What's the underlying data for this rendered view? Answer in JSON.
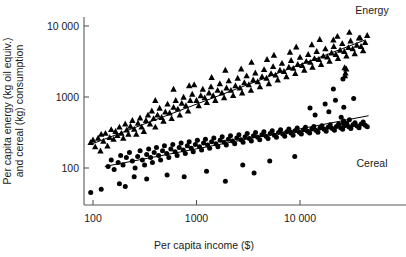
{
  "chart_data": {
    "type": "scatter",
    "title": "",
    "xlabel": "Per capita income ($)",
    "ylabel": "Per capita energy (kg oil equiv.) and cereal (kg) consumption",
    "xscale": "log",
    "yscale": "log",
    "xlim": [
      80,
      50000
    ],
    "ylim": [
      35,
      20000
    ],
    "grid": false,
    "legend_position": "inline-right",
    "xticks": [
      100,
      1000,
      10000
    ],
    "xticklabels": [
      "100",
      "1000",
      "10 000"
    ],
    "yticks": [
      100,
      1000,
      10000
    ],
    "yticklabels": [
      "100",
      "1000",
      "10 000"
    ],
    "series": [
      {
        "name": "Energy",
        "marker": "triangle",
        "color": "#000000",
        "label": "Energy",
        "trendline": {
          "x": [
            95,
            42000
          ],
          "y": [
            215,
            6300
          ]
        },
        "points": [
          [
            95,
            230
          ],
          [
            100,
            250
          ],
          [
            105,
            200
          ],
          [
            112,
            265
          ],
          [
            118,
            175
          ],
          [
            120,
            300
          ],
          [
            126,
            240
          ],
          [
            132,
            310
          ],
          [
            138,
            205
          ],
          [
            145,
            270
          ],
          [
            150,
            350
          ],
          [
            158,
            255
          ],
          [
            165,
            330
          ],
          [
            172,
            290
          ],
          [
            180,
            380
          ],
          [
            188,
            310
          ],
          [
            196,
            265
          ],
          [
            205,
            420
          ],
          [
            212,
            345
          ],
          [
            220,
            300
          ],
          [
            230,
            390
          ],
          [
            240,
            470
          ],
          [
            250,
            355
          ],
          [
            262,
            300
          ],
          [
            272,
            430
          ],
          [
            285,
            510
          ],
          [
            295,
            380
          ],
          [
            310,
            330
          ],
          [
            325,
            470
          ],
          [
            340,
            560
          ],
          [
            355,
            420
          ],
          [
            370,
            640
          ],
          [
            385,
            500
          ],
          [
            400,
            380
          ],
          [
            420,
            560
          ],
          [
            440,
            700
          ],
          [
            460,
            520
          ],
          [
            480,
            460
          ],
          [
            500,
            620
          ],
          [
            525,
            800
          ],
          [
            550,
            600
          ],
          [
            575,
            500
          ],
          [
            600,
            720
          ],
          [
            630,
            900
          ],
          [
            660,
            680
          ],
          [
            690,
            560
          ],
          [
            720,
            820
          ],
          [
            750,
            1000
          ],
          [
            790,
            760
          ],
          [
            830,
            640
          ],
          [
            870,
            900
          ],
          [
            910,
            1100
          ],
          [
            950,
            1500
          ],
          [
            1000,
            900
          ],
          [
            1050,
            760
          ],
          [
            1100,
            1050
          ],
          [
            1150,
            1300
          ],
          [
            1200,
            980
          ],
          [
            1260,
            840
          ],
          [
            1320,
            1150
          ],
          [
            1380,
            1400
          ],
          [
            1450,
            1050
          ],
          [
            1520,
            900
          ],
          [
            1600,
            1250
          ],
          [
            1680,
            1550
          ],
          [
            1760,
            1150
          ],
          [
            1850,
            980
          ],
          [
            1950,
            1350
          ],
          [
            2050,
            1700
          ],
          [
            2150,
            1250
          ],
          [
            2260,
            1060
          ],
          [
            2380,
            1450
          ],
          [
            2500,
            1850
          ],
          [
            2630,
            1350
          ],
          [
            2760,
            1150
          ],
          [
            2900,
            1600
          ],
          [
            3050,
            2000
          ],
          [
            3200,
            1500
          ],
          [
            3360,
            1250
          ],
          [
            3530,
            1750
          ],
          [
            3700,
            2200
          ],
          [
            3900,
            1650
          ],
          [
            4100,
            1400
          ],
          [
            4300,
            1950
          ],
          [
            4500,
            2450
          ],
          [
            4750,
            1850
          ],
          [
            5000,
            1550
          ],
          [
            5250,
            2150
          ],
          [
            5500,
            2700
          ],
          [
            5800,
            2050
          ],
          [
            6100,
            1750
          ],
          [
            6400,
            2400
          ],
          [
            6700,
            3000
          ],
          [
            7000,
            2300
          ],
          [
            7400,
            1950
          ],
          [
            7800,
            2650
          ],
          [
            8200,
            3300
          ],
          [
            8600,
            2550
          ],
          [
            9000,
            2150
          ],
          [
            9500,
            2900
          ],
          [
            10000,
            3650
          ],
          [
            10500,
            2800
          ],
          [
            11000,
            2400
          ],
          [
            11500,
            3200
          ],
          [
            12000,
            4000
          ],
          [
            12600,
            3100
          ],
          [
            13200,
            2650
          ],
          [
            13800,
            3500
          ],
          [
            14500,
            4400
          ],
          [
            15200,
            3400
          ],
          [
            16000,
            2900
          ],
          [
            16800,
            3800
          ],
          [
            17600,
            4800
          ],
          [
            18400,
            3700
          ],
          [
            19300,
            3200
          ],
          [
            20200,
            4200
          ],
          [
            21200,
            5200
          ],
          [
            22200,
            4000
          ],
          [
            23300,
            3500
          ],
          [
            24400,
            4600
          ],
          [
            25600,
            5700
          ],
          [
            26800,
            4400
          ],
          [
            28100,
            3800
          ],
          [
            29400,
            5000
          ],
          [
            30800,
            6200
          ],
          [
            32300,
            4800
          ],
          [
            33800,
            4100
          ],
          [
            35400,
            5400
          ],
          [
            37100,
            6800
          ],
          [
            38900,
            5200
          ],
          [
            40700,
            4500
          ],
          [
            42600,
            5900
          ],
          [
            44600,
            7400
          ],
          [
            400,
            900
          ],
          [
            850,
            1450
          ],
          [
            1900,
            2400
          ],
          [
            3400,
            3100
          ],
          [
            5600,
            3900
          ],
          [
            9200,
            5100
          ],
          [
            15500,
            6500
          ],
          [
            23000,
            7200
          ],
          [
            30000,
            8200
          ],
          [
            38000,
            6900
          ],
          [
            600,
            1300
          ],
          [
            1400,
            1900
          ],
          [
            2700,
            2500
          ],
          [
            4800,
            3400
          ],
          [
            8000,
            4300
          ],
          [
            13000,
            5500
          ],
          [
            21000,
            6400
          ],
          [
            28000,
            2500
          ],
          [
            27000,
            2600
          ],
          [
            27500,
            2200
          ],
          [
            27200,
            2000
          ]
        ]
      },
      {
        "name": "Cereal",
        "marker": "circle",
        "color": "#000000",
        "label": "Cereal",
        "trendline": {
          "x": [
            130,
            46000
          ],
          "y": [
            105,
            545
          ]
        },
        "points": [
          [
            95,
            45
          ],
          [
            120,
            50
          ],
          [
            140,
            105
          ],
          [
            150,
            130
          ],
          [
            160,
            95
          ],
          [
            175,
            120
          ],
          [
            185,
            150
          ],
          [
            195,
            110
          ],
          [
            210,
            140
          ],
          [
            225,
            165
          ],
          [
            240,
            125
          ],
          [
            255,
            100
          ],
          [
            270,
            145
          ],
          [
            285,
            175
          ],
          [
            300,
            130
          ],
          [
            315,
            110
          ],
          [
            330,
            155
          ],
          [
            345,
            185
          ],
          [
            360,
            140
          ],
          [
            375,
            120
          ],
          [
            390,
            165
          ],
          [
            410,
            195
          ],
          [
            430,
            150
          ],
          [
            450,
            130
          ],
          [
            470,
            175
          ],
          [
            490,
            205
          ],
          [
            515,
            160
          ],
          [
            540,
            140
          ],
          [
            565,
            185
          ],
          [
            590,
            215
          ],
          [
            620,
            170
          ],
          [
            650,
            150
          ],
          [
            680,
            195
          ],
          [
            710,
            225
          ],
          [
            745,
            180
          ],
          [
            780,
            160
          ],
          [
            815,
            205
          ],
          [
            850,
            235
          ],
          [
            890,
            190
          ],
          [
            930,
            170
          ],
          [
            975,
            215
          ],
          [
            1020,
            245
          ],
          [
            1070,
            200
          ],
          [
            1120,
            180
          ],
          [
            1170,
            225
          ],
          [
            1220,
            255
          ],
          [
            1280,
            210
          ],
          [
            1340,
            190
          ],
          [
            1400,
            235
          ],
          [
            1470,
            265
          ],
          [
            1540,
            220
          ],
          [
            1610,
            200
          ],
          [
            1690,
            245
          ],
          [
            1770,
            275
          ],
          [
            1850,
            230
          ],
          [
            1940,
            210
          ],
          [
            2030,
            255
          ],
          [
            2130,
            285
          ],
          [
            2230,
            240
          ],
          [
            2340,
            220
          ],
          [
            2450,
            265
          ],
          [
            2570,
            295
          ],
          [
            2690,
            250
          ],
          [
            2820,
            230
          ],
          [
            2950,
            275
          ],
          [
            3090,
            305
          ],
          [
            3240,
            260
          ],
          [
            3390,
            240
          ],
          [
            3550,
            285
          ],
          [
            3720,
            315
          ],
          [
            3900,
            270
          ],
          [
            4080,
            250
          ],
          [
            4280,
            295
          ],
          [
            4480,
            325
          ],
          [
            4690,
            280
          ],
          [
            4910,
            260
          ],
          [
            5150,
            305
          ],
          [
            5390,
            335
          ],
          [
            5650,
            290
          ],
          [
            5920,
            270
          ],
          [
            6200,
            315
          ],
          [
            6490,
            345
          ],
          [
            6800,
            300
          ],
          [
            7120,
            280
          ],
          [
            7460,
            325
          ],
          [
            7810,
            355
          ],
          [
            8180,
            310
          ],
          [
            8570,
            290
          ],
          [
            8970,
            335
          ],
          [
            9400,
            365
          ],
          [
            9840,
            320
          ],
          [
            10300,
            300
          ],
          [
            10800,
            345
          ],
          [
            11300,
            375
          ],
          [
            11800,
            330
          ],
          [
            12400,
            310
          ],
          [
            13000,
            355
          ],
          [
            13600,
            385
          ],
          [
            14200,
            340
          ],
          [
            14900,
            320
          ],
          [
            15600,
            365
          ],
          [
            16300,
            395
          ],
          [
            17100,
            350
          ],
          [
            17900,
            330
          ],
          [
            18700,
            375
          ],
          [
            19600,
            405
          ],
          [
            20500,
            360
          ],
          [
            21500,
            340
          ],
          [
            22500,
            385
          ],
          [
            23600,
            415
          ],
          [
            24700,
            370
          ],
          [
            25800,
            350
          ],
          [
            27000,
            395
          ],
          [
            28300,
            425
          ],
          [
            29600,
            380
          ],
          [
            31000,
            360
          ],
          [
            32500,
            405
          ],
          [
            34000,
            435
          ],
          [
            35600,
            390
          ],
          [
            37200,
            370
          ],
          [
            39000,
            415
          ],
          [
            40800,
            445
          ],
          [
            42700,
            400
          ],
          [
            44700,
            380
          ],
          [
            330,
            70
          ],
          [
            520,
            80
          ],
          [
            760,
            75
          ],
          [
            1250,
            90
          ],
          [
            2800,
            110
          ],
          [
            5100,
            125
          ],
          [
            8900,
            145
          ],
          [
            12500,
            700
          ],
          [
            17500,
            800
          ],
          [
            22000,
            900
          ],
          [
            26500,
            720
          ],
          [
            21000,
            1300
          ],
          [
            26000,
            1800
          ],
          [
            33000,
            950
          ],
          [
            14000,
            560
          ],
          [
            19000,
            620
          ],
          [
            25000,
            520
          ],
          [
            30000,
            480
          ],
          [
            180,
            60
          ],
          [
            205,
            55
          ],
          [
            250,
            75
          ],
          [
            1900,
            65
          ],
          [
            3600,
            85
          ],
          [
            26200,
            430
          ],
          [
            26800,
            400
          ],
          [
            26400,
            460
          ]
        ]
      }
    ],
    "annotations": [
      {
        "text": "Energy",
        "x_px": 372,
        "y_px": 14
      },
      {
        "text": "Cereal",
        "x_px": 372,
        "y_px": 167
      }
    ]
  }
}
